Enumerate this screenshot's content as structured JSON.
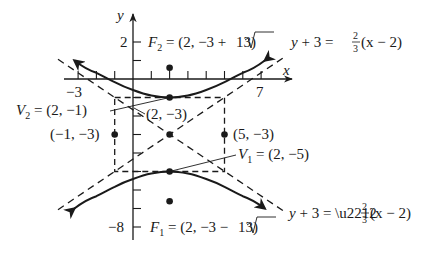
{
  "figure": {
    "type": "hyperbola-graph",
    "equation": "(y+3)^2/4 - (x-2)^2/9 = 1",
    "colors": {
      "ink": "#1a1a1a",
      "background": "#ffffff"
    },
    "axes": {
      "x_label": "x",
      "y_label": "y",
      "x_tick_labels": {
        "left": "−3",
        "right": "7"
      },
      "y_tick_labels": {
        "top": "2",
        "bottom": "−8"
      },
      "x_range": [
        -3.5,
        8.5
      ],
      "y_range": [
        -8,
        3
      ]
    },
    "center": {
      "label": "(2, −3)",
      "x": 2,
      "y": -3
    },
    "vertices": [
      {
        "name": "V",
        "sub": "2",
        "text": " = (2, −1)",
        "x": 2,
        "y": -1
      },
      {
        "name": "V",
        "sub": "1",
        "text": " = (2, −5)",
        "x": 2,
        "y": -5
      }
    ],
    "foci": [
      {
        "name": "F",
        "sub": "2",
        "text_pre": " = (2, −3 + ",
        "radical": "13",
        "text_post": ")",
        "x": 2,
        "y": 0.606
      },
      {
        "name": "F",
        "sub": "1",
        "text_pre": " = (2, −3 − ",
        "radical": "13",
        "text_post": ")",
        "x": 2,
        "y": -6.606
      }
    ],
    "box_points": [
      {
        "label": "(−1, −3)",
        "x": -1,
        "y": -3
      },
      {
        "label": "(5, −3)",
        "x": 5,
        "y": -3
      }
    ],
    "asymptotes": [
      {
        "lhs": "y + 3 = ",
        "sign": "",
        "num": "2",
        "den": "3",
        "rhs": "(x − 2)",
        "slope": 0.6667
      },
      {
        "lhs": "y + 3 = −",
        "sign": "−",
        "num": "2",
        "den": "3",
        "rhs": "(x − 2)",
        "slope": -0.6667
      }
    ]
  }
}
